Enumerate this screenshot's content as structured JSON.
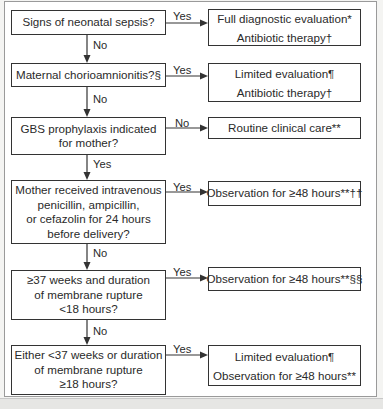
{
  "diagram": {
    "type": "flowchart",
    "decisions": [
      {
        "id": "q1",
        "lines": [
          "Signs of neonatal sepsis?"
        ]
      },
      {
        "id": "q2",
        "lines": [
          "Maternal chorioamnionitis?§"
        ]
      },
      {
        "id": "q3",
        "lines": [
          "GBS prophylaxis indicated",
          "for mother?"
        ]
      },
      {
        "id": "q4",
        "lines": [
          "Mother received intravenous",
          "penicillin, ampicillin,",
          "or cefazolin for 24 hours",
          "before delivery?"
        ]
      },
      {
        "id": "q5",
        "lines": [
          "≥37 weeks and duration",
          "of membrane rupture",
          "<18 hours?"
        ]
      },
      {
        "id": "q6",
        "lines": [
          "Either <37 weeks or duration",
          "of membrane rupture",
          "≥18 hours?"
        ]
      }
    ],
    "outcomes": [
      {
        "id": "o1",
        "lines": [
          "Full diagnostic evaluation*",
          "Antibiotic therapy†"
        ]
      },
      {
        "id": "o2",
        "lines": [
          "Limited evaluation¶",
          "Antibiotic therapy†"
        ]
      },
      {
        "id": "o3",
        "lines": [
          "Routine clinical care**"
        ]
      },
      {
        "id": "o4",
        "lines": [
          "Observation for ≥48 hours**††"
        ]
      },
      {
        "id": "o5",
        "lines": [
          "Observation for ≥48 hours**§§"
        ]
      },
      {
        "id": "o6",
        "lines": [
          "Limited evaluation¶",
          "Observation for ≥48 hours**"
        ]
      }
    ],
    "branch_labels": {
      "q1_right": "Yes",
      "q1_down": "No",
      "q2_right": "Yes",
      "q2_down": "No",
      "q3_right": "No",
      "q3_down": "Yes",
      "q4_right": "Yes",
      "q4_down": "No",
      "q5_right": "Yes",
      "q5_down": "No",
      "q6_right": "Yes"
    }
  }
}
